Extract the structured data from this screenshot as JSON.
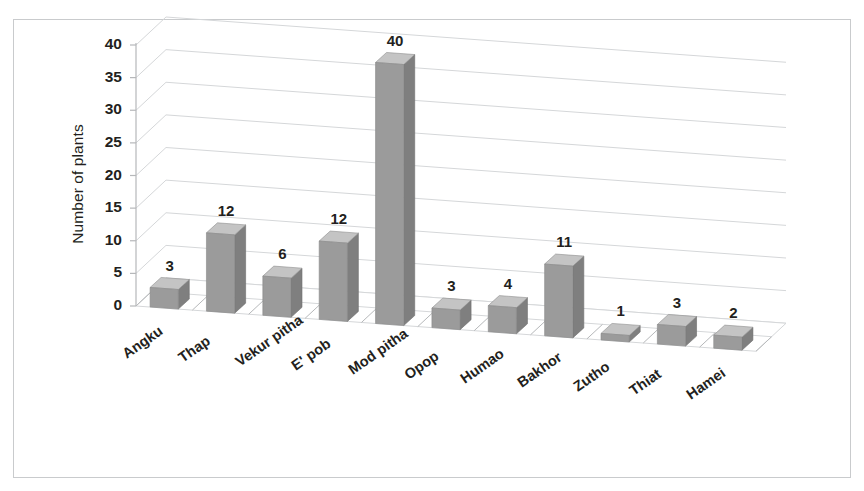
{
  "chart_data": {
    "type": "bar",
    "title": "",
    "subtitle": "",
    "xlabel": "",
    "ylabel": "Number of plants",
    "categories": [
      "Angku",
      "Thap",
      "Vekur pitha",
      "E' pob",
      "Mod pitha",
      "Opop",
      "Humao",
      "Bakhor",
      "Zutho",
      "Thiat",
      "Hamei"
    ],
    "values": [
      3,
      12,
      6,
      12,
      40,
      3,
      4,
      11,
      1,
      3,
      2
    ],
    "value_labels": [
      "3",
      "12",
      "6",
      "12",
      "40",
      "3",
      "4",
      "11",
      "1",
      "3",
      "2"
    ],
    "ylim": [
      0,
      40
    ],
    "ytick_values": [
      0,
      5,
      10,
      15,
      20,
      25,
      30,
      35,
      40
    ],
    "ytick_labels": [
      "0",
      "5",
      "10",
      "15",
      "20",
      "25",
      "30",
      "35",
      "40"
    ],
    "grid": true,
    "legend": false,
    "legend_position": "none",
    "style_3d": true,
    "bar_color": "#9b9b9b",
    "bar_top_color": "#c4c4c4",
    "bar_side_color": "#7f7f7f",
    "grid_color": "#d5d7d9",
    "axis_color": "#b6b8ba",
    "text_color": "#231f20",
    "background_color": "#ffffff",
    "border_color": "#c9cbcd"
  }
}
